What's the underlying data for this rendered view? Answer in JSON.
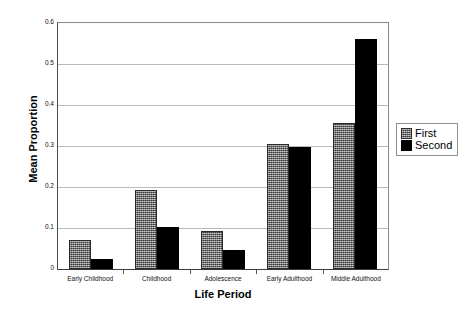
{
  "chart_data": {
    "type": "bar",
    "title": "",
    "xlabel": "Life Period",
    "ylabel": "Mean Proportion",
    "ylim": [
      0,
      0.6
    ],
    "ytick_labels": [
      "0.6",
      "0.5",
      "0.4",
      "0.3",
      "0.2",
      "0.1",
      "0"
    ],
    "ytick_values": [
      0.6,
      0.5,
      0.4,
      0.3,
      0.2,
      0.1,
      0
    ],
    "grid": true,
    "legend_position": "right",
    "categories": [
      "Early Childhood",
      "Childhood",
      "Adolescence",
      "Early Adulthood",
      "Middle Adulthood"
    ],
    "series": [
      {
        "name": "First",
        "color": "#6e6e6e",
        "values": [
          0.07,
          0.192,
          0.093,
          0.305,
          0.355
        ]
      },
      {
        "name": "Second",
        "color": "#000000",
        "values": [
          0.025,
          0.102,
          0.046,
          0.298,
          0.56
        ]
      }
    ]
  },
  "legend": {
    "items": [
      {
        "label": "First"
      },
      {
        "label": "Second"
      }
    ]
  }
}
